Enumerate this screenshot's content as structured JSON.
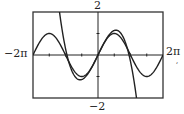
{
  "chart_data": {
    "type": "line",
    "title": "",
    "xlabel": "",
    "ylabel": "",
    "xlim": [
      -6.2832,
      6.2832
    ],
    "ylim": [
      -2,
      2
    ],
    "xlim_labels": {
      "min": "−2π",
      "max": "2π"
    },
    "ylim_labels": {
      "min": "−2",
      "max": "2"
    },
    "grid": false,
    "legend": null,
    "x_ticks": [
      -4.7124,
      -3.1416,
      -1.5708,
      1.5708,
      3.1416,
      4.7124
    ],
    "y_ticks": [
      -1,
      1
    ],
    "series": [
      {
        "name": "sin x",
        "function": "y = sin(x)",
        "x": [
          -6.2832,
          -4.7124,
          -3.1416,
          -1.5708,
          0,
          1.5708,
          3.1416,
          4.7124,
          6.2832
        ],
        "values": [
          0,
          1,
          0,
          -1,
          0,
          1,
          0,
          -1,
          0
        ]
      },
      {
        "name": "cubic approximation",
        "function": "y ≈ x − x³/9",
        "x": [
          -3.67,
          -3.0,
          -2.0,
          -1.0,
          0,
          1.0,
          2.0,
          3.0,
          3.67
        ],
        "values": [
          2,
          0,
          -1.11,
          -0.89,
          0,
          0.89,
          1.11,
          0,
          -2
        ]
      }
    ],
    "annotations": [
      "2",
      "−2",
      "−2π",
      "2π"
    ]
  },
  "labels": {
    "ymax": "2",
    "ymin": "−2",
    "xmin": "−2π",
    "xmax": "2π",
    "trailing_mark": ","
  },
  "colors": {
    "ink": "#222222",
    "frame": "#333333",
    "background": "#ffffff"
  }
}
